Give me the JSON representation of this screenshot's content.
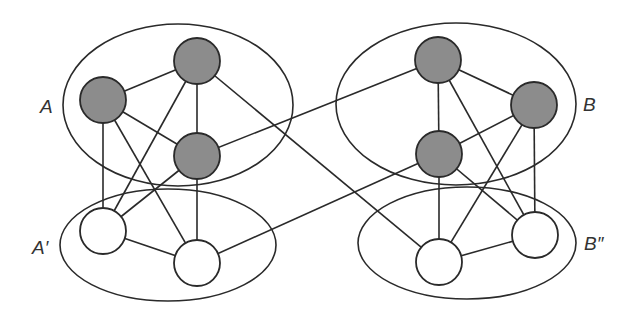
{
  "colors": {
    "stroke": "#2a2a2a",
    "gray_node": "#8c8c8c",
    "white_node": "#ffffff"
  },
  "groups": [
    {
      "id": "A",
      "label": "A",
      "cx": 178,
      "cy": 105,
      "rx": 115,
      "ry": 81,
      "label_x": 40,
      "label_y": 113
    },
    {
      "id": "A'",
      "label": "A′",
      "cx": 168,
      "cy": 245,
      "rx": 108,
      "ry": 56,
      "label_x": 32,
      "label_y": 254
    },
    {
      "id": "B",
      "label": "B",
      "cx": 456,
      "cy": 104,
      "rx": 120,
      "ry": 81,
      "label_x": 583,
      "label_y": 111
    },
    {
      "id": "B''",
      "label": "B″",
      "cx": 467,
      "cy": 243,
      "rx": 109,
      "ry": 56,
      "label_x": 584,
      "label_y": 250
    }
  ],
  "nodes": [
    {
      "id": "A1",
      "group": "A",
      "x": 103,
      "y": 100,
      "r": 23,
      "fill": "gray"
    },
    {
      "id": "A2",
      "group": "A",
      "x": 197,
      "y": 61,
      "r": 23,
      "fill": "gray"
    },
    {
      "id": "A3",
      "group": "A",
      "x": 197,
      "y": 156,
      "r": 23,
      "fill": "gray"
    },
    {
      "id": "A'1",
      "group": "A'",
      "x": 103,
      "y": 231,
      "r": 23,
      "fill": "white"
    },
    {
      "id": "A'2",
      "group": "A'",
      "x": 197,
      "y": 263,
      "r": 23,
      "fill": "white"
    },
    {
      "id": "B1",
      "group": "B",
      "x": 438,
      "y": 60,
      "r": 23,
      "fill": "gray"
    },
    {
      "id": "B2",
      "group": "B",
      "x": 534,
      "y": 105,
      "r": 23,
      "fill": "gray"
    },
    {
      "id": "B3",
      "group": "B",
      "x": 439,
      "y": 154,
      "r": 23,
      "fill": "gray"
    },
    {
      "id": "B''1",
      "group": "B''",
      "x": 439,
      "y": 262,
      "r": 23,
      "fill": "white"
    },
    {
      "id": "B''2",
      "group": "B''",
      "x": 535,
      "y": 235,
      "r": 23,
      "fill": "white"
    }
  ],
  "edges": [
    [
      "A1",
      "A2"
    ],
    [
      "A1",
      "A3"
    ],
    [
      "A2",
      "A3"
    ],
    [
      "A1",
      "A'1"
    ],
    [
      "A1",
      "A'2"
    ],
    [
      "A2",
      "A'1"
    ],
    [
      "A3",
      "A'1"
    ],
    [
      "A3",
      "A'2"
    ],
    [
      "A'1",
      "A'2"
    ],
    [
      "B1",
      "B2"
    ],
    [
      "B1",
      "B3"
    ],
    [
      "B3",
      "B2"
    ],
    [
      "B1",
      "B''2"
    ],
    [
      "B2",
      "B''1"
    ],
    [
      "B2",
      "B''2"
    ],
    [
      "B3",
      "B''1"
    ],
    [
      "B3",
      "B''2"
    ],
    [
      "B''1",
      "B''2"
    ],
    [
      "A3",
      "B1"
    ],
    [
      "A2",
      "B''1"
    ],
    [
      "A'2",
      "B3"
    ]
  ]
}
